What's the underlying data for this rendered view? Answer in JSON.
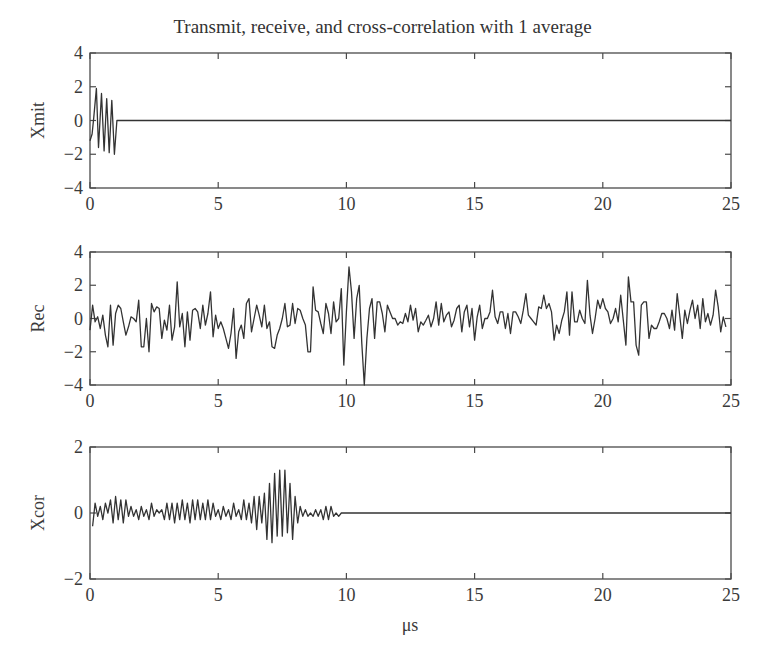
{
  "title": "Transmit, receive, and cross-correlation with 1 average",
  "xlabel": "μs",
  "colors": {
    "line": "#333333",
    "axes": "#4a4a4a",
    "background": "#ffffff"
  },
  "chart_data": [
    {
      "type": "line",
      "title": "Transmit, receive, and cross-correlation with 1 average",
      "ylabel": "Xmit",
      "xlabel": "",
      "xlim": [
        0,
        25
      ],
      "ylim": [
        -4,
        4
      ],
      "xticks": [
        0,
        5,
        10,
        15,
        20,
        25
      ],
      "yticks": [
        -4,
        -2,
        0,
        2,
        4
      ],
      "grid": false,
      "x": [
        0,
        0.08,
        0.15,
        0.25,
        0.33,
        0.45,
        0.55,
        0.65,
        0.75,
        0.85,
        0.95,
        1.05,
        1.1,
        25
      ],
      "values": [
        -1.2,
        -0.8,
        0.2,
        1.9,
        -1.6,
        1.6,
        -1.8,
        1.3,
        -1.9,
        1.2,
        -2.0,
        0,
        0,
        0
      ]
    },
    {
      "type": "line",
      "ylabel": "Rec",
      "xlabel": "",
      "xlim": [
        0,
        25
      ],
      "ylim": [
        -4,
        4
      ],
      "xticks": [
        0,
        5,
        10,
        15,
        20,
        25
      ],
      "yticks": [
        -4,
        -2,
        0,
        2,
        4
      ],
      "grid": false,
      "x": [
        0,
        0.1,
        0.2,
        0.3,
        0.4,
        0.5,
        0.6,
        0.7,
        0.8,
        0.9,
        1.0,
        1.1,
        1.2,
        1.3,
        1.4,
        1.5,
        1.6,
        1.7,
        1.8,
        1.9,
        2.0,
        2.1,
        2.2,
        2.3,
        2.4,
        2.5,
        2.6,
        2.7,
        2.8,
        2.9,
        3.0,
        3.1,
        3.2,
        3.3,
        3.4,
        3.5,
        3.6,
        3.7,
        3.8,
        3.9,
        4.0,
        4.1,
        4.2,
        4.3,
        4.4,
        4.5,
        4.6,
        4.7,
        4.8,
        4.9,
        5.0,
        5.1,
        5.2,
        5.3,
        5.4,
        5.5,
        5.6,
        5.7,
        5.8,
        5.9,
        6.0,
        6.1,
        6.2,
        6.3,
        6.4,
        6.5,
        6.6,
        6.7,
        6.8,
        6.9,
        7.0,
        7.1,
        7.2,
        7.3,
        7.4,
        7.5,
        7.6,
        7.7,
        7.8,
        7.9,
        8.0,
        8.1,
        8.2,
        8.3,
        8.4,
        8.5,
        8.6,
        8.7,
        8.8,
        8.9,
        9.0,
        9.1,
        9.2,
        9.3,
        9.4,
        9.5,
        9.6,
        9.7,
        9.8,
        9.9,
        10.0,
        10.1,
        10.2,
        10.3,
        10.4,
        10.5,
        10.6,
        10.7,
        10.8,
        10.9,
        11.0,
        11.1,
        11.2,
        11.3,
        11.4,
        11.5,
        11.6,
        11.7,
        11.8,
        11.9,
        12.0,
        12.1,
        12.2,
        12.3,
        12.4,
        12.5,
        12.6,
        12.7,
        12.8,
        12.9,
        13.0,
        13.1,
        13.2,
        13.3,
        13.4,
        13.5,
        13.6,
        13.7,
        13.8,
        13.9,
        14.0,
        14.1,
        14.2,
        14.3,
        14.4,
        14.5,
        14.6,
        14.7,
        14.8,
        14.9,
        15.0,
        15.1,
        15.2,
        15.3,
        15.4,
        15.5,
        15.6,
        15.7,
        15.8,
        15.9,
        16.0,
        16.1,
        16.2,
        16.3,
        16.4,
        16.5,
        16.6,
        16.7,
        16.8,
        16.9,
        17.0,
        17.1,
        17.2,
        17.3,
        17.4,
        17.5,
        17.6,
        17.7,
        17.8,
        17.9,
        18.0,
        18.1,
        18.2,
        18.3,
        18.4,
        18.5,
        18.6,
        18.7,
        18.8,
        18.9,
        19.0,
        19.1,
        19.2,
        19.3,
        19.4,
        19.5,
        19.6,
        19.7,
        19.8,
        19.9,
        20.0,
        20.1,
        20.2,
        20.3,
        20.4,
        20.5,
        20.6,
        20.7,
        20.8,
        20.9,
        21.0,
        21.1,
        21.2,
        21.3,
        21.4,
        21.5,
        21.6,
        21.7,
        21.8,
        21.9,
        22.0,
        22.1,
        22.2,
        22.3,
        22.4,
        22.5,
        22.6,
        22.7,
        22.8,
        22.9,
        23.0,
        23.1,
        23.2,
        23.3,
        23.4,
        23.5,
        23.6,
        23.7,
        23.8,
        23.9,
        24.0,
        24.1,
        24.2,
        24.3,
        24.4,
        24.5,
        24.6,
        24.7,
        24.8,
        24.9,
        25.0
      ],
      "values": [
        -0.7,
        0.8,
        -0.2,
        0.1,
        -0.6,
        0.2,
        -1.0,
        -1.7,
        0.8,
        -1.6,
        0.3,
        0.8,
        0.6,
        -0.2,
        -1.0,
        -0.5,
        0.1,
        0.0,
        -0.2,
        1.1,
        -1.7,
        -1.7,
        0.0,
        -2.0,
        0.9,
        0.4,
        0.7,
        0.6,
        -1.2,
        -0.1,
        -0.7,
        0.8,
        -1.3,
        -0.5,
        2.2,
        -0.5,
        0.3,
        -1.7,
        0.4,
        -1.3,
        0.5,
        0.6,
        0.4,
        -0.6,
        0.8,
        -0.4,
        0.3,
        1.6,
        -1.1,
        0.2,
        -0.6,
        -0.2,
        -0.6,
        -1.2,
        -1.8,
        -0.9,
        0.6,
        -2.4,
        -0.8,
        -0.4,
        -1.2,
        0.9,
        1.2,
        -0.8,
        0.0,
        0.8,
        0.2,
        -0.5,
        0.8,
        -0.6,
        -0.2,
        -1.7,
        -1.8,
        -1.0,
        -0.6,
        0.0,
        0.9,
        -0.5,
        -0.4,
        0.9,
        -0.3,
        0.6,
        0.5,
        0.0,
        -0.4,
        -2.0,
        -2.0,
        1.9,
        0.5,
        0.4,
        -0.3,
        -0.9,
        0.9,
        0.3,
        -0.9,
        1.0,
        -0.2,
        0.0,
        1.8,
        -2.8,
        0.4,
        3.1,
        1.6,
        -1.2,
        1.2,
        2.0,
        -1.5,
        -4.0,
        -1.2,
        0.6,
        1.2,
        -1.2,
        1.0,
        1.0,
        0.3,
        -0.8,
        0.8,
        0.4,
        0.0,
        0.0,
        -0.4,
        -0.2,
        -0.3,
        0.3,
        -0.2,
        0.8,
        -0.1,
        0.6,
        -0.8,
        -0.2,
        -0.4,
        -0.1,
        0.2,
        -0.5,
        0.0,
        1.0,
        -0.4,
        0.9,
        -0.2,
        0.2,
        0.4,
        -0.5,
        -0.1,
        0.6,
        0.8,
        -0.8,
        0.4,
        0.8,
        -0.5,
        0.6,
        -1.3,
        0.1,
        0.8,
        -0.6,
        0.0,
        0.0,
        0.4,
        1.7,
        0.1,
        -0.3,
        0.4,
        0.4,
        -0.6,
        0.3,
        -0.9,
        0.4,
        0.4,
        0.1,
        -0.3,
        0.5,
        1.5,
        0.2,
        0.0,
        -0.2,
        -0.4,
        0.7,
        0.6,
        1.4,
        0.6,
        0.9,
        0.4,
        -1.3,
        -0.4,
        -0.9,
        -0.1,
        0.4,
        1.6,
        -1.0,
        1.6,
        -0.2,
        -0.2,
        0.5,
        0.0,
        -0.3,
        2.3,
        0.2,
        -0.9,
        0.0,
        1.1,
        0.6,
        1.2,
        0.6,
        0.4,
        -0.3,
        0.0,
        0.6,
        -0.2,
        1.4,
        -0.1,
        -1.6,
        2.5,
        1.0,
        1.0,
        -1.6,
        -2.2,
        0.8,
        1.0,
        1.0,
        -1.2,
        -0.4,
        -0.6,
        -0.6,
        -0.2,
        0.3,
        0.3,
        0.0,
        -0.6,
        0.5,
        -0.7,
        1.5,
        0.2,
        -1.2,
        0.5,
        -0.3,
        0.5,
        1.1,
        0.0,
        0.8,
        -0.6,
        1.2,
        -0.2,
        0.3,
        -0.4,
        0.2,
        1.7,
        0.7,
        -0.8,
        0.1,
        -0.5
      ],
      "approximate": true
    },
    {
      "type": "line",
      "ylabel": "Xcor",
      "xlabel": "μs",
      "xlim": [
        0,
        25
      ],
      "ylim": [
        -2,
        2
      ],
      "xticks": [
        0,
        5,
        10,
        15,
        20,
        25
      ],
      "yticks": [
        -2,
        0,
        2
      ],
      "grid": false,
      "x": [
        0.1,
        0.2,
        0.3,
        0.4,
        0.5,
        0.6,
        0.7,
        0.8,
        0.9,
        1.0,
        1.1,
        1.2,
        1.3,
        1.4,
        1.5,
        1.6,
        1.7,
        1.8,
        1.9,
        2.0,
        2.1,
        2.2,
        2.3,
        2.4,
        2.5,
        2.6,
        2.7,
        2.8,
        2.9,
        3.0,
        3.1,
        3.2,
        3.3,
        3.4,
        3.5,
        3.6,
        3.7,
        3.8,
        3.9,
        4.0,
        4.1,
        4.2,
        4.3,
        4.4,
        4.5,
        4.6,
        4.7,
        4.8,
        4.9,
        5.0,
        5.1,
        5.2,
        5.3,
        5.4,
        5.5,
        5.6,
        5.7,
        5.8,
        5.9,
        6.0,
        6.1,
        6.2,
        6.3,
        6.4,
        6.5,
        6.6,
        6.7,
        6.8,
        6.9,
        7.0,
        7.1,
        7.2,
        7.3,
        7.4,
        7.5,
        7.6,
        7.7,
        7.8,
        7.9,
        8.0,
        8.1,
        8.2,
        8.3,
        8.4,
        8.5,
        8.6,
        8.7,
        8.8,
        8.9,
        9.0,
        9.1,
        9.2,
        9.3,
        9.4,
        9.5,
        9.6,
        9.7,
        9.8,
        9.9,
        10.0,
        10.1,
        10.2,
        10.3,
        10.4,
        10.5,
        10.6,
        10.7,
        10.8,
        10.9,
        11.0,
        11.1,
        11.2,
        11.3,
        11.4,
        11.5,
        11.6,
        11.7,
        11.8,
        11.9,
        12.0,
        12.1,
        12.2,
        12.3,
        12.4,
        12.5,
        12.6,
        12.7,
        12.8,
        13.0,
        25.0
      ],
      "values": [
        -0.4,
        0.3,
        -0.1,
        0.2,
        -0.2,
        0.3,
        0.0,
        0.4,
        -0.3,
        0.5,
        -0.2,
        0.4,
        -0.3,
        0.4,
        -0.1,
        0.2,
        -0.1,
        0.1,
        -0.2,
        0.2,
        -0.1,
        0.1,
        -0.2,
        0.3,
        -0.1,
        0.1,
        0.0,
        0.1,
        -0.2,
        0.3,
        -0.2,
        0.3,
        -0.3,
        0.3,
        -0.2,
        0.4,
        -0.2,
        0.3,
        -0.3,
        0.4,
        -0.2,
        0.4,
        -0.2,
        0.3,
        -0.2,
        0.4,
        -0.2,
        0.3,
        -0.1,
        0.1,
        -0.2,
        0.2,
        -0.1,
        0.1,
        -0.2,
        0.3,
        -0.1,
        0.1,
        -0.2,
        0.4,
        -0.2,
        0.3,
        -0.3,
        0.5,
        -0.5,
        0.5,
        -0.3,
        0.6,
        -0.8,
        0.9,
        -0.9,
        1.2,
        -0.7,
        1.3,
        -0.7,
        1.3,
        -0.6,
        0.9,
        -0.8,
        0.5,
        -0.3,
        0.2,
        -0.1,
        0.1,
        -0.1,
        0.0,
        -0.1,
        0.1,
        -0.1,
        0.1,
        -0.2,
        0.2,
        -0.2,
        0.2,
        -0.1,
        0.0,
        -0.1,
        0.0,
        0.0,
        0.0,
        0.0,
        0.0,
        0.0,
        0.0,
        0.0,
        0.0,
        0.0,
        0.0,
        0.0,
        0.0,
        0.0,
        0.0,
        0.0,
        0.0,
        0.0,
        0.0,
        0.0,
        0.0,
        0.0,
        0.0,
        0.0,
        0.0,
        0.0,
        0.0,
        0.0,
        0.0,
        0.0,
        0.0,
        0.0,
        0.0
      ],
      "approximate": true
    }
  ]
}
